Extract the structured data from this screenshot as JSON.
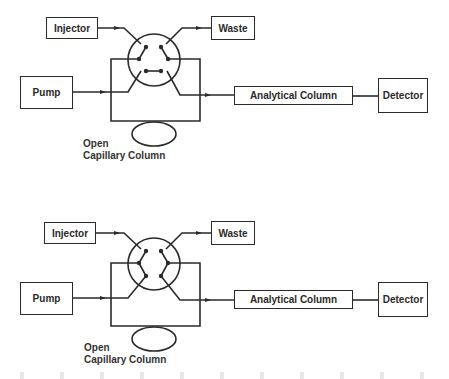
{
  "diagrams": [
    {
      "position": "load",
      "labels": {
        "injector": "Injector",
        "waste": "Waste",
        "pump": "Pump",
        "analytical_column": "Analytical Column",
        "detector": "Detector",
        "capillary_line1": "Open",
        "capillary_line2": "Capillary Column"
      }
    },
    {
      "position": "inject",
      "labels": {
        "injector": "Injector",
        "waste": "Waste",
        "pump": "Pump",
        "analytical_column": "Analytical Column",
        "detector": "Detector",
        "capillary_line1": "Open",
        "capillary_line2": "Capillary Column"
      }
    }
  ],
  "colors": {
    "line": "#2a2a2a",
    "background": "#ffffff"
  }
}
